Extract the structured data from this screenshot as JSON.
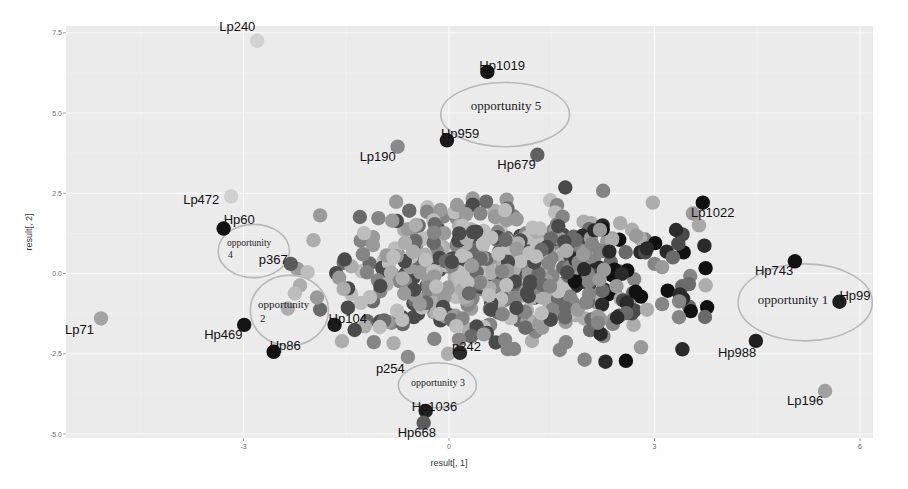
{
  "chart_data": {
    "type": "scatter",
    "title": "",
    "xlabel": "result[, 1]",
    "ylabel": "result[, 2]",
    "xlim": [
      -5.6,
      6.2
    ],
    "ylim": [
      -5.1,
      7.7
    ],
    "x_ticks": [
      -3,
      0,
      3,
      6
    ],
    "x_tick_labels": [
      "-3",
      "0",
      "3",
      "6"
    ],
    "y_ticks": [
      -5.0,
      -2.5,
      0.0,
      2.5,
      5.0,
      7.5
    ],
    "y_tick_labels": [
      "-5.0",
      "-2.5",
      "0.0",
      "2.5",
      "5.0",
      "7.5"
    ],
    "grid": true,
    "background": "#ebebeb",
    "legend": null,
    "labeled_points": [
      {
        "label": "Lp240",
        "x": -2.8,
        "y": 7.25,
        "shade": "#d2d2d2"
      },
      {
        "label": "Hp1019",
        "x": 0.56,
        "y": 6.28,
        "shade": "#151515"
      },
      {
        "label": "Hp959",
        "x": -0.03,
        "y": 4.15,
        "shade": "#1a1a1a"
      },
      {
        "label": "Lp190",
        "x": -0.75,
        "y": 3.95,
        "shade": "#8a8a8a"
      },
      {
        "label": "Hp679",
        "x": 1.29,
        "y": 3.7,
        "shade": "#606060"
      },
      {
        "label": "Lp472",
        "x": -3.18,
        "y": 2.4,
        "shade": "#d0d0d0"
      },
      {
        "label": "Hp60",
        "x": -3.29,
        "y": 1.4,
        "shade": "#111111"
      },
      {
        "label": "p367",
        "x": -2.31,
        "y": 0.3,
        "shade": "#5a5a5a"
      },
      {
        "label": "Lp1022",
        "x": 3.65,
        "y": 1.5,
        "shade": "#a8a8a8"
      },
      {
        "label": "Hp743",
        "x": 5.05,
        "y": 0.38,
        "shade": "#121212"
      },
      {
        "label": "Hp99",
        "x": 5.7,
        "y": -0.88,
        "shade": "#1e1e1e"
      },
      {
        "label": "Hp988",
        "x": 4.48,
        "y": -2.1,
        "shade": "#202020"
      },
      {
        "label": "Lp196",
        "x": 5.49,
        "y": -3.66,
        "shade": "#a0a0a0"
      },
      {
        "label": "Lp71",
        "x": -5.08,
        "y": -1.4,
        "shade": "#a4a4a4"
      },
      {
        "label": "Hp469",
        "x": -2.99,
        "y": -1.6,
        "shade": "#141414"
      },
      {
        "label": "Hp86",
        "x": -2.56,
        "y": -2.44,
        "shade": "#121212"
      },
      {
        "label": "Hp104",
        "x": -1.67,
        "y": -1.6,
        "shade": "#1c1c1c"
      },
      {
        "label": "p254",
        "x": -0.6,
        "y": -2.6,
        "shade": "#8c8c8c"
      },
      {
        "label": "p242",
        "x": 0.16,
        "y": -2.47,
        "shade": "#2a2a2a"
      },
      {
        "label": "Hp1036",
        "x": -0.34,
        "y": -4.28,
        "shade": "#202020"
      },
      {
        "label": "Hp668",
        "x": -0.37,
        "y": -4.65,
        "shade": "#5c5c5c"
      }
    ],
    "cluster": {
      "description": "dense cloud of several hundred unlabeled points in grayscale shades",
      "x_range": [
        -2.6,
        3.9
      ],
      "y_range": [
        -3.2,
        2.8
      ],
      "center": [
        0.9,
        0.0
      ],
      "count_estimate": 650,
      "shades": [
        "#111111",
        "#2a2a2a",
        "#4a4a4a",
        "#6a6a6a",
        "#858585",
        "#9a9a9a",
        "#adadad",
        "#bdbdbd"
      ]
    },
    "annotations": [
      {
        "text": "opportunity  1",
        "shape": "ellipse",
        "cx": 5.2,
        "cy": -0.9,
        "rx": 0.98,
        "ry": 1.2
      },
      {
        "text": "opportunity\n2",
        "shape": "ellipse",
        "cx": -2.33,
        "cy": -1.15,
        "rx": 0.57,
        "ry": 1.1
      },
      {
        "text": "opportunity  3",
        "shape": "ellipse",
        "cx": -0.17,
        "cy": -3.48,
        "rx": 0.57,
        "ry": 0.7
      },
      {
        "text": "opportunity\n4",
        "shape": "ellipse",
        "cx": -2.85,
        "cy": 0.7,
        "rx": 0.52,
        "ry": 0.83
      },
      {
        "text": "opportunity  5",
        "shape": "ellipse",
        "cx": 0.82,
        "cy": 4.95,
        "rx": 0.94,
        "ry": 1.0
      }
    ]
  },
  "axes": {
    "xlabel": "result[, 1]",
    "ylabel": "result[, 2]"
  },
  "annotations_text": {
    "opp1": "opportunity  1",
    "opp2_line1": "opportunity",
    "opp2_line2": "2",
    "opp3": "opportunity  3",
    "opp4_line1": "opportunity",
    "opp4_line2": "4",
    "opp5": "opportunity  5"
  }
}
